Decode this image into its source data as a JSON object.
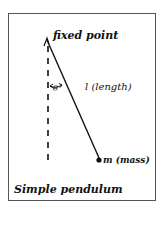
{
  "diagram": {
    "title": "Simple pendulum",
    "labels": {
      "pivot": "fixed point",
      "string": "l (length)",
      "bob": "m (mass)",
      "angle": "θ"
    },
    "elements": {
      "pivot_point": [
        47,
        40
      ],
      "bob_point": [
        99,
        160
      ],
      "vertical_reference": "dashed line from pivot downward",
      "angle_arrow": "double-headed arc between vertical and string"
    },
    "colors": {
      "line": "#111111",
      "frame": "#555555",
      "background": "#ffffff"
    }
  }
}
